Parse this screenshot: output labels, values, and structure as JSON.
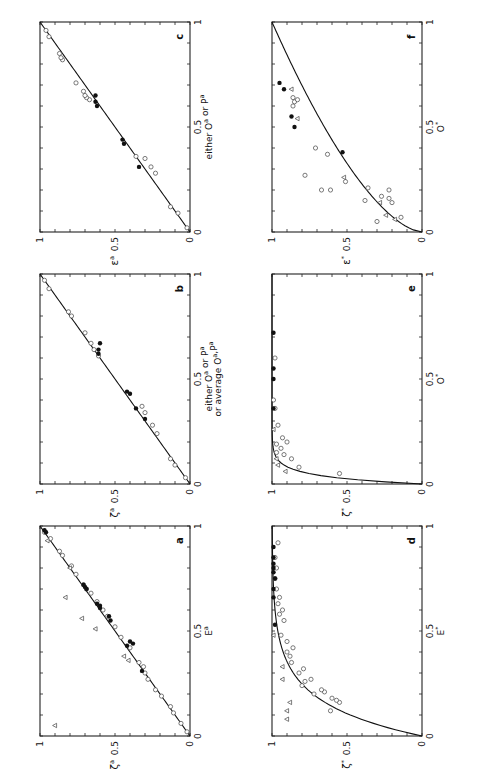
{
  "chart_data": [
    {
      "panel": "a",
      "type": "scatter",
      "xlabel": "E^a",
      "ylabel": "ζ^a",
      "xlim": [
        0,
        1
      ],
      "ylim": [
        0,
        1
      ],
      "x_ticks": [
        "0",
        "0.5",
        "1"
      ],
      "y_ticks": [
        "0",
        "0.5",
        "1"
      ],
      "fit": {
        "type": "line",
        "from": [
          0,
          0
        ],
        "to": [
          1,
          1
        ]
      },
      "series": [
        {
          "name": "open circles",
          "marker": "circle-open",
          "points": [
            [
              0.02,
              0.02
            ],
            [
              0.06,
              0.06
            ],
            [
              0.11,
              0.11
            ],
            [
              0.14,
              0.13
            ],
            [
              0.19,
              0.19
            ],
            [
              0.22,
              0.23
            ],
            [
              0.27,
              0.28
            ],
            [
              0.3,
              0.3
            ],
            [
              0.33,
              0.31
            ],
            [
              0.35,
              0.34
            ],
            [
              0.42,
              0.4
            ],
            [
              0.47,
              0.46
            ],
            [
              0.52,
              0.5
            ],
            [
              0.57,
              0.55
            ],
            [
              0.6,
              0.58
            ],
            [
              0.64,
              0.62
            ],
            [
              0.68,
              0.66
            ],
            [
              0.7,
              0.69
            ],
            [
              0.72,
              0.71
            ],
            [
              0.77,
              0.76
            ],
            [
              0.81,
              0.79
            ],
            [
              0.86,
              0.85
            ],
            [
              0.88,
              0.87
            ],
            [
              0.94,
              0.93
            ],
            [
              0.97,
              0.97
            ]
          ]
        },
        {
          "name": "filled circles",
          "marker": "circle-filled",
          "points": [
            [
              0.31,
              0.32
            ],
            [
              0.43,
              0.42
            ],
            [
              0.45,
              0.4
            ],
            [
              0.44,
              0.38
            ],
            [
              0.55,
              0.53
            ],
            [
              0.57,
              0.54
            ],
            [
              0.61,
              0.6
            ],
            [
              0.62,
              0.6
            ],
            [
              0.63,
              0.62
            ],
            [
              0.7,
              0.69
            ],
            [
              0.71,
              0.7
            ],
            [
              0.72,
              0.71
            ],
            [
              0.97,
              0.96
            ],
            [
              0.98,
              0.97
            ]
          ]
        },
        {
          "name": "triangles",
          "marker": "triangle-open",
          "points": [
            [
              0.05,
              0.9
            ],
            [
              0.36,
              0.41
            ],
            [
              0.38,
              0.44
            ],
            [
              0.51,
              0.63
            ],
            [
              0.56,
              0.72
            ],
            [
              0.66,
              0.83
            ],
            [
              0.8,
              0.8
            ],
            [
              0.93,
              0.95
            ]
          ]
        }
      ]
    },
    {
      "panel": "b",
      "type": "scatter",
      "xlabel": "either O^a or P^a or average O^a,P^a",
      "ylabel": "ζ^a",
      "xlim": [
        0,
        1
      ],
      "ylim": [
        0,
        1
      ],
      "x_ticks": [
        "0",
        "0.5",
        "1"
      ],
      "y_ticks": [
        "0",
        "0.5",
        "1"
      ],
      "fit": {
        "type": "line",
        "from": [
          0,
          0
        ],
        "to": [
          1,
          1
        ]
      },
      "series": [
        {
          "name": "open circles",
          "marker": "circle-open",
          "points": [
            [
              0.03,
              0.03
            ],
            [
              0.09,
              0.1
            ],
            [
              0.12,
              0.13
            ],
            [
              0.24,
              0.22
            ],
            [
              0.28,
              0.25
            ],
            [
              0.34,
              0.3
            ],
            [
              0.37,
              0.32
            ],
            [
              0.61,
              0.61
            ],
            [
              0.64,
              0.64
            ],
            [
              0.67,
              0.66
            ],
            [
              0.72,
              0.7
            ],
            [
              0.8,
              0.79
            ],
            [
              0.82,
              0.81
            ],
            [
              0.93,
              0.94
            ],
            [
              0.97,
              0.97
            ]
          ]
        },
        {
          "name": "filled circles",
          "marker": "circle-filled",
          "points": [
            [
              0.31,
              0.3
            ],
            [
              0.36,
              0.36
            ],
            [
              0.43,
              0.4
            ],
            [
              0.44,
              0.42
            ],
            [
              0.62,
              0.61
            ],
            [
              0.64,
              0.61
            ],
            [
              0.67,
              0.6
            ]
          ]
        }
      ]
    },
    {
      "panel": "c",
      "type": "scatter",
      "xlabel": "either O^a or P^a",
      "ylabel": "ε^a",
      "xlim": [
        0,
        1
      ],
      "ylim": [
        0,
        1
      ],
      "x_ticks": [
        "0",
        "0.5",
        "1"
      ],
      "y_ticks": [
        "0",
        "0.5",
        "1"
      ],
      "fit": {
        "type": "line",
        "from": [
          0,
          0
        ],
        "to": [
          1,
          1
        ]
      },
      "series": [
        {
          "name": "open circles",
          "marker": "circle-open",
          "points": [
            [
              0.02,
              0.02
            ],
            [
              0.09,
              0.08
            ],
            [
              0.12,
              0.13
            ],
            [
              0.28,
              0.23
            ],
            [
              0.31,
              0.26
            ],
            [
              0.35,
              0.3
            ],
            [
              0.36,
              0.36
            ],
            [
              0.63,
              0.67
            ],
            [
              0.64,
              0.69
            ],
            [
              0.65,
              0.7
            ],
            [
              0.67,
              0.71
            ],
            [
              0.71,
              0.76
            ],
            [
              0.82,
              0.85
            ],
            [
              0.83,
              0.86
            ],
            [
              0.85,
              0.87
            ],
            [
              0.93,
              0.94
            ],
            [
              0.96,
              0.96
            ]
          ]
        },
        {
          "name": "filled circles",
          "marker": "circle-filled",
          "points": [
            [
              0.31,
              0.34
            ],
            [
              0.42,
              0.44
            ],
            [
              0.44,
              0.45
            ],
            [
              0.6,
              0.62
            ],
            [
              0.62,
              0.63
            ],
            [
              0.65,
              0.63
            ]
          ]
        }
      ]
    },
    {
      "panel": "d",
      "type": "scatter",
      "xlabel": "E*",
      "ylabel": "ζ*",
      "xlim": [
        0,
        1
      ],
      "ylim": [
        0,
        1
      ],
      "x_ticks": [
        "0",
        "0.5",
        "1"
      ],
      "y_ticks": [
        "0",
        "0.5",
        "1"
      ],
      "fit": {
        "type": "curve",
        "shape": "saturating",
        "description": "rises steeply from (0,0) and saturates near 1 by x≈0.6"
      },
      "series": [
        {
          "name": "open circles",
          "marker": "circle-open",
          "points": [
            [
              0.12,
              0.61
            ],
            [
              0.16,
              0.55
            ],
            [
              0.17,
              0.57
            ],
            [
              0.18,
              0.6
            ],
            [
              0.2,
              0.72
            ],
            [
              0.21,
              0.65
            ],
            [
              0.22,
              0.67
            ],
            [
              0.24,
              0.8
            ],
            [
              0.26,
              0.78
            ],
            [
              0.27,
              0.74
            ],
            [
              0.3,
              0.82
            ],
            [
              0.32,
              0.79
            ],
            [
              0.35,
              0.87
            ],
            [
              0.38,
              0.88
            ],
            [
              0.4,
              0.9
            ],
            [
              0.42,
              0.86
            ],
            [
              0.45,
              0.9
            ],
            [
              0.48,
              0.94
            ],
            [
              0.55,
              0.92
            ],
            [
              0.58,
              0.95
            ],
            [
              0.6,
              0.93
            ],
            [
              0.63,
              0.96
            ],
            [
              0.66,
              0.95
            ],
            [
              0.7,
              0.97
            ],
            [
              0.75,
              0.98
            ],
            [
              0.8,
              0.97
            ],
            [
              0.85,
              0.98
            ],
            [
              0.92,
              0.96
            ]
          ]
        },
        {
          "name": "filled circles",
          "marker": "circle-filled",
          "points": [
            [
              0.53,
              0.98
            ],
            [
              0.66,
              0.99
            ],
            [
              0.7,
              0.99
            ],
            [
              0.75,
              0.98
            ],
            [
              0.78,
              0.99
            ],
            [
              0.8,
              0.99
            ],
            [
              0.82,
              0.99
            ],
            [
              0.85,
              0.99
            ],
            [
              0.9,
              0.99
            ]
          ]
        },
        {
          "name": "triangles",
          "marker": "triangle-open",
          "points": [
            [
              0.08,
              0.9
            ],
            [
              0.12,
              0.9
            ],
            [
              0.16,
              0.88
            ],
            [
              0.27,
              0.93
            ],
            [
              0.33,
              0.93
            ],
            [
              0.48,
              0.99
            ]
          ]
        }
      ]
    },
    {
      "panel": "e",
      "type": "scatter",
      "xlabel": "O*",
      "ylabel": "ζ*",
      "xlim": [
        0,
        1
      ],
      "ylim": [
        0,
        1
      ],
      "x_ticks": [
        "0",
        "0.5",
        "1"
      ],
      "y_ticks": [
        "0",
        "0.5",
        "1"
      ],
      "fit": {
        "type": "curve",
        "shape": "saturating",
        "description": "rises almost vertically near x=0 and saturates at 1 by x≈0.2"
      },
      "series": [
        {
          "name": "open circles",
          "marker": "circle-open",
          "points": [
            [
              0.05,
              0.55
            ],
            [
              0.08,
              0.82
            ],
            [
              0.12,
              0.87
            ],
            [
              0.14,
              0.92
            ],
            [
              0.15,
              0.97
            ],
            [
              0.17,
              0.94
            ],
            [
              0.19,
              0.97
            ],
            [
              0.2,
              0.9
            ],
            [
              0.22,
              0.93
            ],
            [
              0.28,
              0.96
            ],
            [
              0.36,
              0.98
            ],
            [
              0.4,
              0.99
            ],
            [
              0.6,
              0.98
            ]
          ]
        },
        {
          "name": "filled circles",
          "marker": "circle-filled",
          "points": [
            [
              0.36,
              0.99
            ],
            [
              0.5,
              0.99
            ],
            [
              0.55,
              0.99
            ],
            [
              0.72,
              0.99
            ]
          ]
        },
        {
          "name": "triangles",
          "marker": "triangle-open",
          "points": [
            [
              0.06,
              0.91
            ],
            [
              0.09,
              0.96
            ],
            [
              0.12,
              0.97
            ],
            [
              0.26,
              0.99
            ]
          ]
        }
      ]
    },
    {
      "panel": "f",
      "type": "scatter",
      "xlabel": "O*",
      "ylabel": "ε*",
      "xlim": [
        0,
        1
      ],
      "ylim": [
        0,
        1
      ],
      "x_ticks": [
        "0",
        "0.5",
        "1"
      ],
      "y_ticks": [
        "0",
        "0.5",
        "1"
      ],
      "fit": {
        "type": "curve",
        "shape": "concave",
        "description": "rises from (0,0) to (1,1), bowed above the diagonal"
      },
      "series": [
        {
          "name": "open circles",
          "marker": "circle-open",
          "points": [
            [
              0.05,
              0.3
            ],
            [
              0.07,
              0.14
            ],
            [
              0.14,
              0.2
            ],
            [
              0.15,
              0.38
            ],
            [
              0.16,
              0.22
            ],
            [
              0.17,
              0.27
            ],
            [
              0.2,
              0.67
            ],
            [
              0.2,
              0.61
            ],
            [
              0.21,
              0.36
            ],
            [
              0.2,
              0.22
            ],
            [
              0.24,
              0.51
            ],
            [
              0.27,
              0.78
            ],
            [
              0.37,
              0.63
            ],
            [
              0.4,
              0.71
            ],
            [
              0.6,
              0.86
            ],
            [
              0.62,
              0.85
            ],
            [
              0.63,
              0.83
            ],
            [
              0.64,
              0.86
            ]
          ]
        },
        {
          "name": "filled circles",
          "marker": "circle-filled",
          "points": [
            [
              0.38,
              0.53
            ],
            [
              0.5,
              0.85
            ],
            [
              0.55,
              0.87
            ],
            [
              0.71,
              0.95
            ],
            [
              0.68,
              0.92
            ]
          ]
        },
        {
          "name": "triangles",
          "marker": "triangle-open",
          "points": [
            [
              0.06,
              0.18
            ],
            [
              0.08,
              0.24
            ],
            [
              0.14,
              0.28
            ],
            [
              0.26,
              0.52
            ],
            [
              0.54,
              0.83
            ],
            [
              0.68,
              0.87
            ]
          ]
        }
      ]
    }
  ],
  "panels": {
    "a": {
      "letter": "a",
      "xlabel": "E",
      "xlabel_sup": "a",
      "ylabel": "ζ",
      "ylabel_sup": "a"
    },
    "b": {
      "letter": "b",
      "xlabel_line1": "either O",
      "xlabel_line1_sup1": "a",
      "xlabel_line1_mid": " or P",
      "xlabel_line1_sup2": "a",
      "xlabel_line2": "or average O",
      "xlabel_line2_sup1": "a",
      "xlabel_line2_mid": ",P",
      "xlabel_line2_sup2": "a",
      "ylabel": "ζ",
      "ylabel_sup": "a"
    },
    "c": {
      "letter": "c",
      "xlabel": "either O",
      "xlabel_sup1": "a",
      "xlabel_mid": " or P",
      "xlabel_sup2": "a",
      "ylabel": "ε",
      "ylabel_sup": "a"
    },
    "d": {
      "letter": "d",
      "xlabel": "E",
      "xlabel_sup": "*",
      "ylabel": "ζ",
      "ylabel_sup": "*"
    },
    "e": {
      "letter": "e",
      "xlabel": "O",
      "xlabel_sup": "*",
      "ylabel": "ζ",
      "ylabel_sup": "*"
    },
    "f": {
      "letter": "f",
      "xlabel": "O",
      "xlabel_sup": "*",
      "ylabel": "ε",
      "ylabel_sup": "*"
    }
  },
  "ticks": {
    "zero": "0",
    "half": "0.5",
    "one": "1"
  }
}
